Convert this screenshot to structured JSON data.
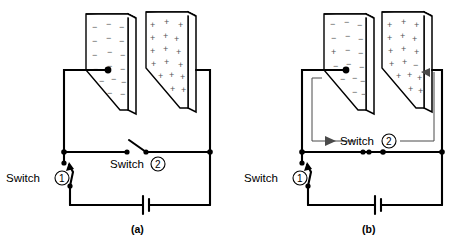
{
  "figure": {
    "panels": [
      {
        "id": "a",
        "caption": "(a)",
        "switch1": {
          "label": "Switch",
          "number": "1",
          "state": "open"
        },
        "switch2": {
          "label": "Switch",
          "number": "2",
          "state": "open"
        },
        "battery": {
          "name": "battery"
        },
        "left_plate": {
          "charge": "negative",
          "symbol": "−",
          "count": 22
        },
        "right_plate": {
          "charge": "positive",
          "symbol": "+",
          "count": 18
        }
      },
      {
        "id": "b",
        "caption": "(b)",
        "switch1": {
          "label": "Switch",
          "number": "1",
          "state": "open"
        },
        "switch2": {
          "label": "Switch",
          "number": "2",
          "state": "closed"
        },
        "battery": {
          "name": "battery"
        },
        "left_plate": {
          "charge": "negative-with-one-positive",
          "symbol": "−",
          "count": 15
        },
        "right_plate": {
          "charge": "positive-with-one-negative",
          "symbol": "+",
          "count": 20
        }
      }
    ],
    "colors": {
      "wire": "#000000",
      "leader": "#4a4a4a",
      "charge_text": "#555555",
      "background": "#ffffff"
    }
  }
}
